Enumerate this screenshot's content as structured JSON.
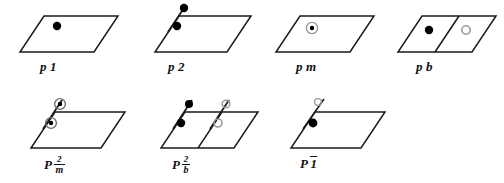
{
  "figure": {
    "background_color": "#ffffff",
    "line_color": "#1a1a1a",
    "filled_marker_color": "#000000",
    "open_marker_color": "#9a9a9a",
    "rows": 2,
    "columns": 4
  },
  "diagrams": [
    {
      "id": "p1",
      "label_text": "p 1",
      "label_prefix": "p",
      "label_suffix": "1",
      "label_kind": "plain",
      "row": 1,
      "column": 1,
      "has_diagonal_axis": false,
      "diagonal_count": 0,
      "has_internal_divider": false,
      "markers": [
        {
          "type": "filled-dot",
          "name": "general-position-dot"
        }
      ],
      "marker_count": 1
    },
    {
      "id": "p2",
      "label_text": "p 2",
      "label_prefix": "p",
      "label_suffix": "2",
      "label_kind": "plain",
      "row": 1,
      "column": 2,
      "has_diagonal_axis": true,
      "diagonal_count": 1,
      "has_internal_divider": false,
      "markers": [
        {
          "type": "filled-dot",
          "name": "general-position-dot"
        },
        {
          "type": "filled-dot",
          "name": "general-position-dot"
        }
      ],
      "marker_count": 2
    },
    {
      "id": "pm",
      "label_text": "p m",
      "label_prefix": "p",
      "label_suffix": "m",
      "label_kind": "plain",
      "row": 1,
      "column": 3,
      "has_diagonal_axis": false,
      "diagonal_count": 0,
      "has_internal_divider": false,
      "markers": [
        {
          "type": "circled-dot",
          "name": "mirror-related-dot"
        }
      ],
      "marker_count": 1
    },
    {
      "id": "pb",
      "label_text": "p b",
      "label_prefix": "p",
      "label_suffix": "b",
      "label_kind": "plain",
      "row": 1,
      "column": 4,
      "has_diagonal_axis": false,
      "diagonal_count": 0,
      "has_internal_divider": true,
      "markers": [
        {
          "type": "filled-dot",
          "name": "general-position-dot"
        },
        {
          "type": "open-circle",
          "name": "glide-related-circle"
        }
      ],
      "marker_count": 2
    },
    {
      "id": "p2-over-m",
      "label_text": "P 2/m",
      "label_prefix": "P",
      "label_numerator": "2",
      "label_denominator": "m",
      "label_kind": "fraction",
      "row": 2,
      "column": 1,
      "has_diagonal_axis": true,
      "diagonal_count": 1,
      "has_internal_divider": false,
      "markers": [
        {
          "type": "circled-dot",
          "name": "mirror-related-dot"
        },
        {
          "type": "circled-dot",
          "name": "mirror-related-dot"
        }
      ],
      "marker_count": 2
    },
    {
      "id": "p2-over-b",
      "label_text": "P 2/b",
      "label_prefix": "P",
      "label_numerator": "2",
      "label_denominator": "b",
      "label_kind": "fraction",
      "row": 2,
      "column": 2,
      "has_diagonal_axis": true,
      "diagonal_count": 2,
      "has_internal_divider": true,
      "markers": [
        {
          "type": "filled-dot",
          "name": "general-position-dot"
        },
        {
          "type": "open-circle",
          "name": "glide-related-circle"
        },
        {
          "type": "filled-dot",
          "name": "general-position-dot"
        },
        {
          "type": "open-circle",
          "name": "glide-related-circle"
        }
      ],
      "marker_count": 4
    },
    {
      "id": "p-bar-1",
      "label_text": "P 1̄",
      "label_prefix": "P",
      "label_suffix": "1",
      "label_kind": "overbar",
      "row": 2,
      "column": 3,
      "has_diagonal_axis": true,
      "diagonal_count": 1,
      "has_internal_divider": false,
      "markers": [
        {
          "type": "open-circle",
          "name": "inversion-related-circle"
        },
        {
          "type": "filled-dot",
          "name": "general-position-dot"
        }
      ],
      "marker_count": 2
    }
  ]
}
